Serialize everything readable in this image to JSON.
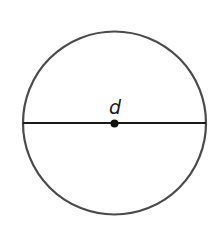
{
  "diagram": {
    "type": "circle-with-diameter",
    "circle": {
      "cx": 114.5,
      "cy": 123,
      "r": 91.5,
      "stroke": "#4a4a4a",
      "stroke_width": 2.2
    },
    "diameter": {
      "x1": 23,
      "y1": 123,
      "x2": 206,
      "y2": 123,
      "stroke": "#1a1a1a",
      "stroke_width": 2.2
    },
    "center_point": {
      "cx": 114.5,
      "cy": 123.5,
      "r": 4,
      "fill": "#111111"
    },
    "label": {
      "text": "d",
      "x": 115,
      "y": 114
    }
  }
}
